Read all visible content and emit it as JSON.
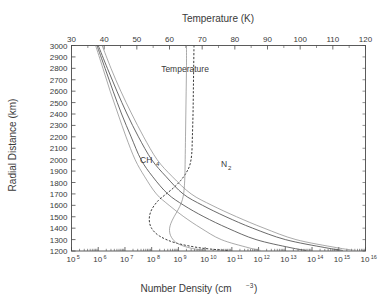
{
  "figure": {
    "background": "#ffffff",
    "line_color": "#4f4f4f",
    "faint_color": "#8e8e8e",
    "text_color": "#3a3a3a"
  },
  "labels": {
    "top_axis_title": "Temperature (K)",
    "bottom_axis_title_main": "Number Density (cm",
    "bottom_axis_title_sup": "−3",
    "bottom_axis_title_tail": ")",
    "y_axis_title": "Radial Distance (km)",
    "annotation_temperature": "Temperature",
    "annotation_ch4_main": "CH",
    "annotation_ch4_sub": "4",
    "annotation_n2_main": "N",
    "annotation_n2_sub": "2"
  },
  "chart_data": {
    "type": "line",
    "title": "",
    "xlabel": "Number Density (cm^-3)",
    "x2label": "Temperature (K)",
    "ylabel": "Radial Distance (km)",
    "grid": false,
    "legend": "none",
    "x_scale": "log",
    "xlim": [
      100000,
      1e+16
    ],
    "x_ticks": [
      100000.0,
      1000000.0,
      10000000.0,
      100000000.0,
      1000000000.0,
      10000000000.0,
      100000000000.0,
      1000000000000.0,
      10000000000000.0,
      100000000000000.0,
      1000000000000000.0,
      1e+16
    ],
    "x_tick_labels": [
      "10",
      "10",
      "10",
      "10",
      "10",
      "10",
      "10",
      "10",
      "10",
      "10",
      "10",
      "10"
    ],
    "x_tick_exponents": [
      "5",
      "6",
      "7",
      "8",
      "9",
      "10",
      "11",
      "12",
      "13",
      "14",
      "15",
      "16"
    ],
    "x2lim": [
      30,
      120
    ],
    "x2_ticks": [
      30,
      40,
      50,
      60,
      70,
      80,
      90,
      100,
      110,
      120
    ],
    "x2_tick_labels": [
      "30",
      "40",
      "50",
      "60",
      "70",
      "80",
      "90",
      "100",
      "110",
      "120"
    ],
    "ylim": [
      1200,
      3000
    ],
    "y_ticks": [
      1200,
      1300,
      1400,
      1500,
      1600,
      1700,
      1800,
      1900,
      2000,
      2100,
      2200,
      2300,
      2400,
      2500,
      2600,
      2700,
      2800,
      2900,
      3000
    ],
    "y_tick_labels": [
      "1200",
      "1300",
      "1400",
      "1500",
      "1600",
      "1700",
      "1800",
      "1900",
      "2000",
      "2100",
      "2200",
      "2300",
      "2400",
      "2500",
      "2600",
      "2700",
      "2800",
      "2900",
      "3000"
    ],
    "series": [
      {
        "name": "N2",
        "axis": "bottom",
        "style": "solid",
        "annotation": "N2",
        "points": [
          [
            1000000.0,
            3000
          ],
          [
            2200000.0,
            2800
          ],
          [
            5000000.0,
            2600
          ],
          [
            12000000.0,
            2400
          ],
          [
            32000000.0,
            2200
          ],
          [
            100000000.0,
            2000
          ],
          [
            350000000.0,
            1850
          ],
          [
            1500000000.0,
            1700
          ],
          [
            8000000000.0,
            1600
          ],
          [
            60000000000.0,
            1500
          ],
          [
            600000000000.0,
            1400
          ],
          [
            10000000000000.0,
            1300
          ],
          [
            300000000000000.0,
            1230
          ],
          [
            1400000000000000.0,
            1205
          ]
        ]
      },
      {
        "name": "CH4",
        "axis": "bottom",
        "style": "solid",
        "annotation": "CH4",
        "points": [
          [
            900000.0,
            3000
          ],
          [
            1800000.0,
            2800
          ],
          [
            3600000.0,
            2600
          ],
          [
            7500000.0,
            2400
          ],
          [
            17000000.0,
            2200
          ],
          [
            40000000.0,
            2000
          ],
          [
            110000000.0,
            1850
          ],
          [
            400000000.0,
            1700
          ],
          [
            1600000000.0,
            1600
          ],
          [
            9000000000.0,
            1500
          ],
          [
            70000000000.0,
            1400
          ],
          [
            800000000000.0,
            1300
          ],
          [
            15000000000000.0,
            1230
          ],
          [
            60000000000000.0,
            1205
          ]
        ]
      },
      {
        "name": "minor-species-a",
        "axis": "bottom",
        "style": "solid-faint",
        "points": [
          [
            1400000.0,
            3000
          ],
          [
            3000000.0,
            2800
          ],
          [
            7000000.0,
            2600
          ],
          [
            18000000.0,
            2400
          ],
          [
            50000000.0,
            2200
          ],
          [
            160000000.0,
            2000
          ],
          [
            600000000.0,
            1850
          ],
          [
            3000000000.0,
            1700
          ],
          [
            18000000000.0,
            1600
          ],
          [
            150000000000.0,
            1500
          ],
          [
            1600000000000.0,
            1400
          ],
          [
            25000000000000.0,
            1300
          ],
          [
            800000000000000.0,
            1230
          ],
          [
            4000000000000000.0,
            1205
          ]
        ]
      },
      {
        "name": "minor-species-b",
        "axis": "bottom",
        "style": "solid-faint",
        "points": [
          [
            800000.0,
            3000
          ],
          [
            1500000.0,
            2800
          ],
          [
            2800000.0,
            2600
          ],
          [
            5500000.0,
            2400
          ],
          [
            11000000.0,
            2200
          ],
          [
            24000000.0,
            2000
          ],
          [
            55000000.0,
            1850
          ],
          [
            150000000.0,
            1700
          ],
          [
            450000000.0,
            1600
          ],
          [
            1600000000.0,
            1500
          ],
          [
            7000000000.0,
            1400
          ],
          [
            40000000000.0,
            1300
          ],
          [
            400000000000.0,
            1230
          ],
          [
            1200000000000.0,
            1205
          ]
        ]
      },
      {
        "name": "temperature-dashed",
        "axis": "top",
        "style": "dashed",
        "annotation": "Temperature",
        "points": [
          [
            67.5,
            3000
          ],
          [
            67.4,
            2800
          ],
          [
            67.3,
            2600
          ],
          [
            67.2,
            2400
          ],
          [
            67.0,
            2200
          ],
          [
            66.8,
            2050
          ],
          [
            66.2,
            1950
          ],
          [
            65.0,
            1880
          ],
          [
            63.5,
            1820
          ],
          [
            61.5,
            1760
          ],
          [
            59.0,
            1700
          ],
          [
            56.5,
            1640
          ],
          [
            54.5,
            1560
          ],
          [
            53.8,
            1480
          ],
          [
            54.5,
            1400
          ],
          [
            57.0,
            1330
          ],
          [
            62.0,
            1270
          ],
          [
            70.0,
            1225
          ],
          [
            78.0,
            1205
          ]
        ]
      },
      {
        "name": "temperature-solid",
        "axis": "top",
        "style": "solid-faint",
        "points": [
          [
            65.2,
            3000
          ],
          [
            65.2,
            2800
          ],
          [
            65.1,
            2600
          ],
          [
            65.0,
            2400
          ],
          [
            64.9,
            2200
          ],
          [
            64.8,
            2000
          ],
          [
            64.7,
            1850
          ],
          [
            64.5,
            1750
          ],
          [
            64.2,
            1680
          ],
          [
            63.6,
            1620
          ],
          [
            62.6,
            1560
          ],
          [
            61.4,
            1500
          ],
          [
            60.4,
            1440
          ],
          [
            60.0,
            1380
          ],
          [
            60.6,
            1320
          ],
          [
            62.5,
            1265
          ],
          [
            66.5,
            1225
          ],
          [
            71.0,
            1205
          ]
        ]
      }
    ]
  }
}
